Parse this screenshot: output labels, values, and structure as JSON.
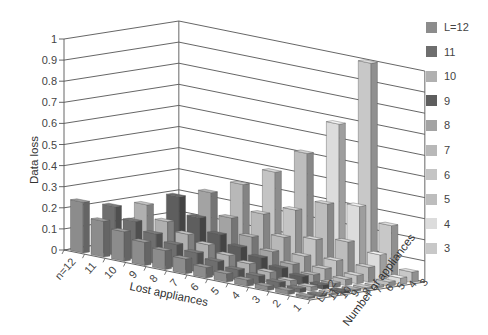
{
  "chart_data": {
    "type": "bar3d",
    "title": "",
    "zlabel": "Data loss",
    "xlabel": "Lost appliances",
    "ylabel": "Number of appliances",
    "zlim": [
      0,
      1
    ],
    "z_ticks": [
      "0",
      "0.1",
      "0.2",
      "0.3",
      "0.4",
      "0.5",
      "0.6",
      "0.7",
      "0.8",
      "0.9",
      "1"
    ],
    "x_categories": [
      "n=12",
      "11",
      "10",
      "9",
      "8",
      "7",
      "6",
      "5",
      "4",
      "3",
      "2",
      "1"
    ],
    "y_categories": [
      "L=12",
      "11",
      "10",
      "9",
      "8",
      "7",
      "6",
      "5",
      "4",
      "3"
    ],
    "grid": true,
    "legend_position": "right",
    "series": [
      {
        "name": "L=12",
        "color": "#8c8c8c",
        "values": [
          0.24,
          0.17,
          0.14,
          0.11,
          0.09,
          0.07,
          0.05,
          0.04,
          0.03,
          0.02,
          0.02,
          0.01
        ]
      },
      {
        "name": "11",
        "color": "#6e6e6e",
        "values": [
          0.0,
          0.23,
          0.18,
          0.14,
          0.11,
          0.09,
          0.07,
          0.05,
          0.04,
          0.03,
          0.02,
          0.01
        ]
      },
      {
        "name": "10",
        "color": "#b0b0b0",
        "values": [
          0.0,
          0.0,
          0.25,
          0.19,
          0.15,
          0.12,
          0.09,
          0.07,
          0.05,
          0.03,
          0.02,
          0.01
        ]
      },
      {
        "name": "9",
        "color": "#5e5e5e",
        "values": [
          0.0,
          0.0,
          0.0,
          0.3,
          0.22,
          0.16,
          0.12,
          0.09,
          0.06,
          0.04,
          0.02,
          0.01
        ]
      },
      {
        "name": "8",
        "color": "#a3a3a3",
        "values": [
          0.0,
          0.0,
          0.0,
          0.0,
          0.33,
          0.23,
          0.16,
          0.11,
          0.07,
          0.04,
          0.02,
          0.01
        ]
      },
      {
        "name": "7",
        "color": "#b8b8b8",
        "values": [
          0.0,
          0.0,
          0.0,
          0.0,
          0.0,
          0.38,
          0.26,
          0.17,
          0.1,
          0.06,
          0.03,
          0.01
        ]
      },
      {
        "name": "6",
        "color": "#c4c4c4",
        "values": [
          0.0,
          0.0,
          0.0,
          0.0,
          0.0,
          0.0,
          0.45,
          0.29,
          0.17,
          0.09,
          0.04,
          0.01
        ]
      },
      {
        "name": "5",
        "color": "#bdbdbd",
        "values": [
          0.0,
          0.0,
          0.0,
          0.0,
          0.0,
          0.0,
          0.0,
          0.55,
          0.33,
          0.17,
          0.07,
          0.02
        ]
      },
      {
        "name": "4",
        "color": "#dcdcdc",
        "values": [
          0.0,
          0.0,
          0.0,
          0.0,
          0.0,
          0.0,
          0.0,
          0.0,
          0.7,
          0.33,
          0.12,
          0.03
        ]
      },
      {
        "name": "3",
        "color": "#c8c8c8",
        "values": [
          0.0,
          0.0,
          0.0,
          0.0,
          0.0,
          0.0,
          0.0,
          0.0,
          0.0,
          1.0,
          0.25,
          0.05
        ]
      }
    ]
  },
  "legend": {
    "items": [
      {
        "label": "L=12",
        "color": "#8c8c8c"
      },
      {
        "label": "11",
        "color": "#6e6e6e"
      },
      {
        "label": "10",
        "color": "#b0b0b0"
      },
      {
        "label": "9",
        "color": "#5e5e5e"
      },
      {
        "label": "8",
        "color": "#a3a3a3"
      },
      {
        "label": "7",
        "color": "#b8b8b8"
      },
      {
        "label": "6",
        "color": "#c4c4c4"
      },
      {
        "label": "5",
        "color": "#bdbdbd"
      },
      {
        "label": "4",
        "color": "#dcdcdc"
      },
      {
        "label": "3",
        "color": "#c8c8c8"
      }
    ]
  }
}
